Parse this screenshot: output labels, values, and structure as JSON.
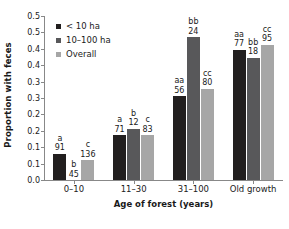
{
  "chart_data": {
    "type": "bar",
    "title": "",
    "xlabel": "Age of forest (years)",
    "ylabel": "Proportion with feces",
    "categories": [
      "0–10",
      "11–30",
      "31–100",
      "Old growth"
    ],
    "ylim": [
      0.0,
      0.5
    ],
    "ytick_values": [
      0.0,
      0.05,
      0.1,
      0.15,
      0.2,
      0.25,
      0.3,
      0.35,
      0.4,
      0.45,
      0.5
    ],
    "ytick_labels": [
      "0.0",
      "0.1",
      "0.1",
      "0.2",
      "0.2",
      "0.3",
      "0.3",
      "0.4",
      "0.4",
      "0.5",
      "0.5"
    ],
    "grid": false,
    "legend_position": "upper-left",
    "series": [
      {
        "name": "< 10 ha",
        "color": "#221f1f",
        "values": [
          0.08,
          0.137,
          0.255,
          0.397
        ],
        "letters": [
          "a",
          "a",
          "aa",
          "aa"
        ],
        "counts": [
          "91",
          "71",
          "56",
          "77"
        ]
      },
      {
        "name": "10–100 ha",
        "color": "#58585a",
        "values": [
          0.0,
          0.157,
          0.435,
          0.372
        ],
        "letters": [
          "b",
          "b",
          "bb",
          "bb"
        ],
        "counts": [
          "45",
          "12",
          "24",
          "18"
        ]
      },
      {
        "name": "Overall",
        "color": "#a6a6a6",
        "values": [
          0.06,
          0.137,
          0.278,
          0.413
        ],
        "letters": [
          "c",
          "c",
          "cc",
          "cc"
        ],
        "counts": [
          "136",
          "83",
          "80",
          "95"
        ]
      }
    ]
  },
  "legend": {
    "items": [
      {
        "label": "< 10 ha",
        "color": "#221f1f"
      },
      {
        "label": "10–100 ha",
        "color": "#58585a"
      },
      {
        "label": "Overall",
        "color": "#a6a6a6"
      }
    ]
  },
  "axes": {
    "y_title": "Proportion with feces",
    "x_title": "Age of forest (years)"
  }
}
